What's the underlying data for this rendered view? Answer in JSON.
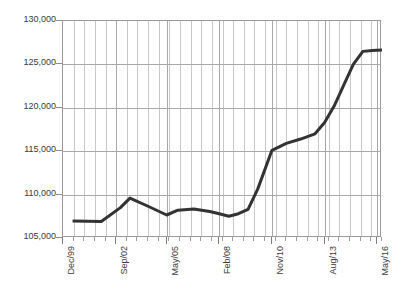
{
  "chart_data": {
    "type": "line",
    "title": "",
    "subtitle": "",
    "xlabel": "",
    "ylabel": "",
    "grid": "vertical-minor-and-horizontal-major",
    "legend": "none",
    "line_color": "#333333",
    "line_width": 3,
    "grid_color": "#c9c9c9",
    "axis_color": "#9a9a9a",
    "text_color": "#3a3a3a",
    "ylim": [
      105000,
      130000
    ],
    "ytick_step": 5000,
    "ytick_labels": [
      "130,000",
      "125,000",
      "120,000",
      "115,000",
      "110,000",
      "105,000"
    ],
    "ytick_values": [
      130000,
      125000,
      120000,
      115000,
      110000,
      105000
    ],
    "xtick_labels": [
      "Dec/99",
      "Sep/02",
      "May/05",
      "Feb/08",
      "Nov/10",
      "Aug/13",
      "May/16"
    ],
    "xtick_positions_months": [
      0,
      33,
      65,
      98,
      131,
      164,
      197
    ],
    "xlim_months": [
      0,
      200
    ],
    "minor_gridline_count": 30,
    "series": [
      {
        "name": "series-1",
        "x_months": [
          6,
          24,
          36,
          42,
          54,
          65,
          72,
          82,
          92,
          98,
          104,
          110,
          116,
          122,
          131,
          140,
          149,
          158,
          164,
          170,
          176,
          182,
          188,
          194,
          200
        ],
        "values": [
          106950,
          106900,
          108500,
          109600,
          108600,
          107650,
          108200,
          108350,
          108050,
          107800,
          107500,
          107800,
          108300,
          110600,
          115100,
          115900,
          116400,
          117000,
          118300,
          120200,
          122600,
          125000,
          126500,
          126600,
          126650
        ]
      }
    ]
  }
}
